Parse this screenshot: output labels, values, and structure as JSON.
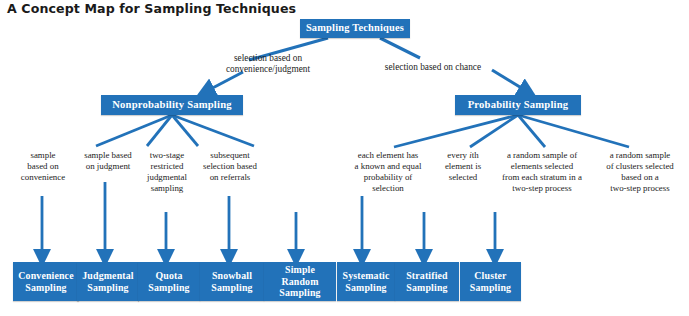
{
  "title": "A Concept Map for Sampling Techniques",
  "colors": {
    "node_blue": "#2272b9",
    "connector_blue": "#2272b9",
    "node_text": "#ffffff",
    "body_text": "#1c1c1c",
    "background": "#ffffff"
  },
  "root": {
    "label": "Sampling Techniques"
  },
  "edge_labels": [
    {
      "id": "to-nonprobability",
      "text": "selection based on convenience/judgment"
    },
    {
      "id": "to-probability",
      "text": "selection based on chance"
    }
  ],
  "categories": [
    {
      "id": "nonprobability",
      "label": "Nonprobability Sampling"
    },
    {
      "id": "probability",
      "label": "Probability Sampling"
    }
  ],
  "branches": [
    {
      "id": "convenience",
      "parent": "nonprobability",
      "description": "sample based on convenience",
      "description_html": "sample<br>based on<br>convenience",
      "leaf": "Convenience Sampling",
      "leaf_html": "Convenience<br>Sampling"
    },
    {
      "id": "judgmental",
      "parent": "nonprobability",
      "description": "sample based on judgment",
      "description_html": "sample based<br>on judgment",
      "leaf": "Judgmental Sampling",
      "leaf_html": "Judgmental<br>Sampling"
    },
    {
      "id": "quota",
      "parent": "nonprobability",
      "description": "two-stage restricted judgmental sampling",
      "description_html": "two-stage<br>restricted<br>judgmental<br>sampling",
      "leaf": "Quota Sampling",
      "leaf_html": "Quota<br>Sampling"
    },
    {
      "id": "snowball",
      "parent": "nonprobability",
      "description": "subsequent selection based on referrals",
      "description_html": "subsequent<br>selection based<br>on referrals",
      "leaf": "Snowball Sampling",
      "leaf_html": "Snowball<br>Sampling"
    },
    {
      "id": "simple-random",
      "parent": "probability",
      "description": "each element has a known and equal probability of selection",
      "description_html": "each element has<br>a known and equal<br>probability of<br>selection",
      "leaf": "Simple Random Sampling",
      "leaf_html": "Simple Random<br>Sampling"
    },
    {
      "id": "systematic",
      "parent": "probability",
      "description": "every ith element is selected",
      "description_html": "every <i>i</i>th<br>element is<br>selected",
      "leaf": "Systematic Sampling",
      "leaf_html": "Systematic<br>Sampling"
    },
    {
      "id": "stratified",
      "parent": "probability",
      "description": "a random sample of elements selected from each stratum in a two-step process",
      "description_html": "a random sample of<br>elements selected<br>from each stratum in a<br>two-step process",
      "leaf": "Stratified Sampling",
      "leaf_html": "Stratified<br>Sampling"
    },
    {
      "id": "cluster",
      "parent": "probability",
      "description": "a random sample of clusters selected based on a two-step process",
      "description_html": "a random sample<br>of clusters selected<br>based on a<br>two-step process",
      "leaf": "Cluster Sampling",
      "leaf_html": "Cluster<br>Sampling"
    }
  ]
}
